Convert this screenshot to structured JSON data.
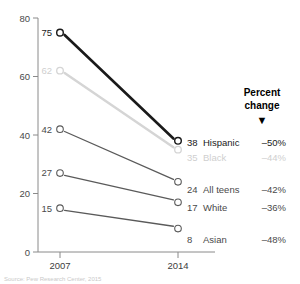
{
  "chart_data": {
    "type": "line",
    "title": "",
    "subtitle": "",
    "xlabel": "",
    "ylabel": "",
    "x": [
      "2007",
      "2014"
    ],
    "categories": [
      "2007",
      "2014"
    ],
    "xtick_labels": [
      "2007",
      "2014"
    ],
    "ytick_labels": [
      "0",
      "20",
      "40",
      "60",
      "80"
    ],
    "yticks": [
      0,
      20,
      40,
      60,
      80
    ],
    "ylim": [
      0,
      80
    ],
    "grid": false,
    "legend": "right-inline-labels",
    "series": [
      {
        "name": "Hispanic",
        "values": [
          75,
          38
        ],
        "start_label": "75",
        "end_label": "38",
        "percent_change": "–50%",
        "color": "#1a1a1a",
        "text_color": "#1a1a1a",
        "line_width": 2.6,
        "emphasis": "high"
      },
      {
        "name": "Black",
        "values": [
          62,
          35
        ],
        "start_label": "62",
        "end_label": "35",
        "percent_change": "–44%",
        "color": "#d5d5d5",
        "text_color": "#cfcfcf",
        "line_width": 2.4,
        "emphasis": "muted"
      },
      {
        "name": "All teens",
        "values": [
          42,
          24
        ],
        "start_label": "42",
        "end_label": "24",
        "percent_change": "–42%",
        "color": "#5a5a5a",
        "text_color": "#4a4a4a",
        "line_width": 1.3,
        "emphasis": "normal"
      },
      {
        "name": "White",
        "values": [
          27,
          17
        ],
        "start_label": "27",
        "end_label": "17",
        "percent_change": "–36%",
        "color": "#5a5a5a",
        "text_color": "#4a4a4a",
        "line_width": 1.3,
        "emphasis": "normal"
      },
      {
        "name": "Asian",
        "values": [
          15,
          8
        ],
        "start_label": "15",
        "end_label": "8",
        "percent_change": "–48%",
        "color": "#5a5a5a",
        "text_color": "#4a4a4a",
        "line_width": 1.3,
        "emphasis": "normal"
      }
    ]
  },
  "annotations": {
    "percent_header_line1": "Percent",
    "percent_header_line2": "change",
    "percent_header_marker": "▼"
  },
  "footnote": {
    "text": "Source: Pew Research Center, 2015"
  }
}
